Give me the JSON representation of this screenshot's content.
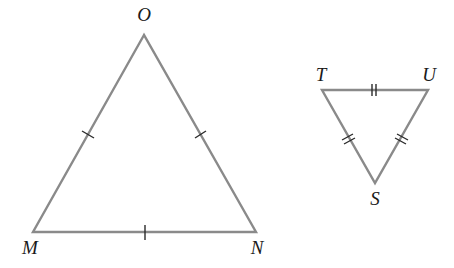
{
  "diagram": {
    "triangles": [
      {
        "name": "MNO",
        "vertices": [
          {
            "label": "O",
            "x": 144,
            "y": 35,
            "label_x": 144,
            "label_y": 21
          },
          {
            "label": "M",
            "x": 33,
            "y": 232,
            "label_x": 30,
            "label_y": 254
          },
          {
            "label": "N",
            "x": 256,
            "y": 232,
            "label_x": 257,
            "label_y": 254
          }
        ],
        "side_marks": {
          "MO": 1,
          "ON": 1,
          "MN": 1
        }
      },
      {
        "name": "STU",
        "vertices": [
          {
            "label": "T",
            "x": 322,
            "y": 90,
            "label_x": 321,
            "label_y": 81
          },
          {
            "label": "U",
            "x": 428,
            "y": 90,
            "label_x": 429,
            "label_y": 81
          },
          {
            "label": "S",
            "x": 375,
            "y": 183,
            "label_x": 375,
            "label_y": 205
          }
        ],
        "side_marks": {
          "TU": 2,
          "TS": 2,
          "US": 2
        }
      }
    ],
    "colors": {
      "edge": "#8a8a8a",
      "tick": "#2a2a2a",
      "label": "#1a1a1a"
    }
  }
}
